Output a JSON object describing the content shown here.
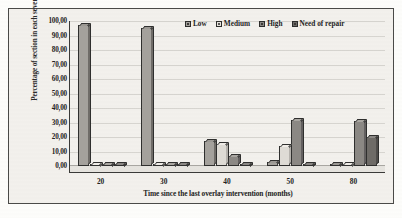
{
  "chart_data": {
    "type": "bar",
    "title": "",
    "xlabel": "Time since the last overlay intervention (months)",
    "ylabel": "Percentage of section in each severity level (%)",
    "categories": [
      "20",
      "30",
      "40",
      "50",
      "80"
    ],
    "series": [
      {
        "name": "Low",
        "values": [
          97.0,
          95.0,
          17.0,
          3.0,
          1.0
        ]
      },
      {
        "name": "Medium",
        "values": [
          1.0,
          1.0,
          15.0,
          14.0,
          1.0
        ]
      },
      {
        "name": "High",
        "values": [
          1.0,
          1.0,
          7.0,
          32.0,
          31.0
        ]
      },
      {
        "name": "Need of repair",
        "values": [
          1.0,
          1.0,
          1.0,
          1.0,
          20.0
        ]
      }
    ],
    "ylim": [
      0,
      100
    ],
    "ytick_labels": [
      "0,00",
      "10,00",
      "20,00",
      "30,00",
      "40,00",
      "50,00",
      "60,00",
      "70,00",
      "80,00",
      "90,00",
      "100,00"
    ],
    "ytick_values": [
      0,
      10,
      20,
      30,
      40,
      50,
      60,
      70,
      80,
      90,
      100
    ],
    "grid": true,
    "legend_position": "top-right",
    "colors": {
      "low": "#a4a19c",
      "medium": "#dedbd5",
      "high": "#8b8884",
      "need_of_repair": "#6e6b67",
      "axis": "#3a3a38",
      "gridline": "#d7d5d0",
      "plot_background": "#f3f1ed"
    }
  }
}
